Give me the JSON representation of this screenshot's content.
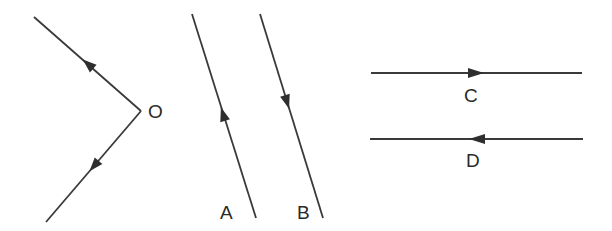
{
  "diagram": {
    "colors": {
      "line": "#3a3a3a",
      "background": "#ffffff"
    },
    "elements": [
      {
        "id": "O",
        "label": "O",
        "type": "vertex",
        "rays": [
          "upper-left (arrow pointing away from O)",
          "lower-left (arrow pointing away from O)"
        ]
      },
      {
        "id": "A",
        "label": "A",
        "type": "line",
        "direction": "upward"
      },
      {
        "id": "B",
        "label": "B",
        "type": "line",
        "direction": "downward"
      },
      {
        "id": "C",
        "label": "C",
        "type": "line",
        "direction": "rightward"
      },
      {
        "id": "D",
        "label": "D",
        "type": "line",
        "direction": "leftward"
      }
    ]
  },
  "labels": {
    "o": "O",
    "a": "A",
    "b": "B",
    "c": "C",
    "d": "D"
  }
}
